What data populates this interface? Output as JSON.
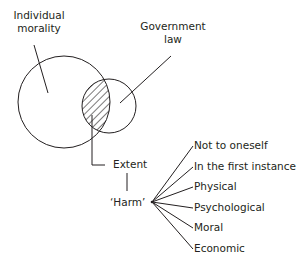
{
  "diagram": {
    "venn": {
      "left_circle_label_line1": "Individual",
      "left_circle_label_line2": "morality",
      "right_circle_label_line1": "Government",
      "right_circle_label_line2": "law",
      "overlap_label": "Extent"
    },
    "harm": {
      "label": "‘Harm’",
      "branches": [
        "Not to oneself",
        "In the first instance",
        "Physical",
        "Psychological",
        "Moral",
        "Economic"
      ]
    },
    "colors": {
      "stroke": "#231f20",
      "background": "#ffffff"
    }
  }
}
